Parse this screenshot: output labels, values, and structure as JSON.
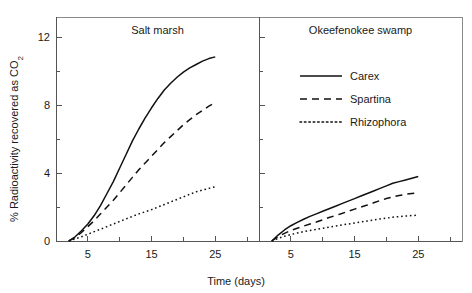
{
  "chart_data": {
    "type": "line",
    "title": "",
    "xlabel": "Time (days)",
    "ylabel": "% Radioactivity recovered as CO2",
    "ylabel_display": "% Radioactivity recovered as CO",
    "ylabel_subscript": "2",
    "xlim": [
      0,
      30
    ],
    "ylim": [
      0,
      13.2
    ],
    "grid": false,
    "legend_position": "top-center-right-panel",
    "x_major_ticks": [
      5,
      15,
      25
    ],
    "x_minor_ticks": [
      10,
      20,
      30
    ],
    "x_tick_labels": [
      "5",
      "15",
      "25"
    ],
    "y_major_ticks": [
      0,
      4,
      8,
      12
    ],
    "y_minor_ticks": [
      2,
      6,
      10
    ],
    "y_tick_labels": [
      "0",
      "4",
      "8",
      "12"
    ],
    "legend": [
      {
        "name": "Carex",
        "style": "solid"
      },
      {
        "name": "Spartina",
        "style": "dashed"
      },
      {
        "name": "Rhizophora",
        "style": "dotted"
      }
    ],
    "panels": [
      {
        "title": "Salt marsh",
        "series": [
          {
            "name": "Carex",
            "style": "solid",
            "x": [
              2,
              3,
              4,
              5,
              6,
              7,
              8,
              9,
              10,
              11,
              12,
              13,
              14,
              15,
              16,
              17,
              18,
              19,
              20,
              21,
              22,
              23,
              24,
              25
            ],
            "y": [
              0.0,
              0.25,
              0.6,
              1.0,
              1.5,
              2.1,
              2.8,
              3.5,
              4.3,
              5.1,
              5.9,
              6.6,
              7.25,
              7.85,
              8.4,
              8.9,
              9.3,
              9.65,
              9.95,
              10.2,
              10.4,
              10.6,
              10.75,
              10.85
            ]
          },
          {
            "name": "Spartina",
            "style": "dashed",
            "x": [
              2,
              3,
              4,
              5,
              6,
              7,
              8,
              9,
              10,
              11,
              12,
              13,
              14,
              15,
              16,
              17,
              18,
              19,
              20,
              21,
              22,
              23,
              24,
              25
            ],
            "y": [
              0.0,
              0.2,
              0.5,
              0.85,
              1.2,
              1.6,
              2.0,
              2.4,
              2.85,
              3.3,
              3.75,
              4.2,
              4.6,
              5.0,
              5.4,
              5.8,
              6.15,
              6.5,
              6.85,
              7.15,
              7.45,
              7.7,
              7.95,
              8.15
            ]
          },
          {
            "name": "Rhizophora",
            "style": "dotted",
            "x": [
              2,
              3,
              4,
              5,
              6,
              7,
              8,
              9,
              10,
              11,
              12,
              13,
              14,
              15,
              16,
              17,
              18,
              19,
              20,
              21,
              22,
              23,
              24,
              25
            ],
            "y": [
              0.0,
              0.12,
              0.25,
              0.4,
              0.55,
              0.7,
              0.85,
              1.0,
              1.15,
              1.3,
              1.45,
              1.6,
              1.72,
              1.85,
              2.0,
              2.15,
              2.3,
              2.45,
              2.6,
              2.75,
              2.9,
              3.0,
              3.1,
              3.2
            ]
          }
        ]
      },
      {
        "title": "Okeefenokee swamp",
        "series": [
          {
            "name": "Carex",
            "style": "solid",
            "x": [
              2,
              3,
              4,
              5,
              6,
              7,
              8,
              9,
              10,
              11,
              12,
              13,
              14,
              15,
              16,
              17,
              18,
              19,
              20,
              21,
              22,
              23,
              24,
              25
            ],
            "y": [
              0.0,
              0.35,
              0.65,
              0.9,
              1.1,
              1.28,
              1.45,
              1.6,
              1.75,
              1.9,
              2.05,
              2.2,
              2.35,
              2.5,
              2.65,
              2.8,
              2.95,
              3.1,
              3.25,
              3.4,
              3.5,
              3.6,
              3.7,
              3.8
            ]
          },
          {
            "name": "Spartina",
            "style": "dashed",
            "x": [
              2,
              3,
              4,
              5,
              6,
              7,
              8,
              9,
              10,
              11,
              12,
              13,
              14,
              15,
              16,
              17,
              18,
              19,
              20,
              21,
              22,
              23,
              24,
              25
            ],
            "y": [
              0.0,
              0.25,
              0.45,
              0.62,
              0.75,
              0.88,
              1.0,
              1.12,
              1.25,
              1.38,
              1.5,
              1.62,
              1.75,
              1.88,
              2.0,
              2.12,
              2.25,
              2.38,
              2.5,
              2.6,
              2.68,
              2.75,
              2.8,
              2.85
            ]
          },
          {
            "name": "Rhizophora",
            "style": "dotted",
            "x": [
              2,
              3,
              4,
              5,
              6,
              7,
              8,
              9,
              10,
              11,
              12,
              13,
              14,
              15,
              16,
              17,
              18,
              19,
              20,
              21,
              22,
              23,
              24,
              25
            ],
            "y": [
              0.0,
              0.15,
              0.28,
              0.38,
              0.47,
              0.55,
              0.62,
              0.68,
              0.75,
              0.82,
              0.88,
              0.95,
              1.0,
              1.06,
              1.12,
              1.18,
              1.24,
              1.3,
              1.35,
              1.4,
              1.44,
              1.47,
              1.5,
              1.52
            ]
          }
        ]
      }
    ]
  },
  "style": {
    "line_color": "#111111",
    "axis_color": "#555555",
    "frame_color": "#8a8a8a",
    "text_color": "#1a1a1a",
    "background": "#ffffff"
  }
}
